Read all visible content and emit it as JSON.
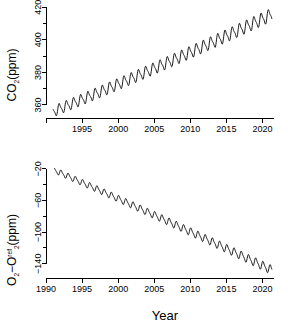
{
  "figure": {
    "width": 288,
    "height": 324,
    "background": "#ffffff",
    "ink": "#000000"
  },
  "chart_data": [
    {
      "id": "co2-panel",
      "type": "line",
      "title": "",
      "xlabel": "",
      "ylabel": "CO2(ppm)",
      "ylabel_parts": {
        "pre": "CO",
        "sub": "2",
        "post": "(ppm)"
      },
      "xlim": [
        1990.0,
        2021.6
      ],
      "ylim": [
        352.0,
        422.0
      ],
      "xticks": [
        1990,
        1995,
        2000,
        2005,
        2010,
        2015,
        2020
      ],
      "xticklabels": [
        "",
        "1995",
        "2000",
        "2005",
        "2010",
        "2015",
        "2020"
      ],
      "yticks": [
        360,
        370,
        380,
        390,
        400,
        410,
        420
      ],
      "yticklabels": [
        "360",
        "",
        "380",
        "",
        "400",
        "",
        "420"
      ],
      "grid": false,
      "legend": "none",
      "series": [
        {
          "name": "CO2 Mauna Loa monthly mean",
          "color": "#000000",
          "trend_start": {
            "x": 1991.0,
            "y": 356.0
          },
          "trend_end": {
            "x": 2021.3,
            "y": 415.5
          },
          "trend_curvature": 4.2,
          "seasonal_amplitude_start": 3.0,
          "seasonal_amplitude_end": 3.6,
          "seasonal_phase": 0.38,
          "samples_per_year": 24
        }
      ]
    },
    {
      "id": "o2-panel",
      "type": "line",
      "title": "",
      "xlabel": "Year",
      "ylabel": "O2-O2ref(ppm)",
      "ylabel_parts": {
        "a": "O",
        "a_sub": "2",
        "dash": "−",
        "b": "O",
        "b_sub": "2",
        "b_sup": "ref",
        "post": "(ppm)"
      },
      "xlim": [
        1990.0,
        2021.6
      ],
      "ylim": [
        -158.0,
        -14.0
      ],
      "xticks": [
        1990,
        1995,
        2000,
        2005,
        2010,
        2015,
        2020
      ],
      "xticklabels": [
        "1990",
        "1995",
        "2000",
        "2005",
        "2010",
        "2015",
        "2020"
      ],
      "yticks": [
        -140,
        -120,
        -100,
        -80,
        -60,
        -40,
        -20
      ],
      "yticklabels": [
        "-140",
        "",
        "-100",
        "",
        "-60",
        "",
        "-20"
      ],
      "grid": false,
      "legend": "none",
      "series": [
        {
          "name": "O2 minus O2 reference, per meg scaled ppm",
          "color": "#000000",
          "trend_start": {
            "x": 1991.2,
            "y": -22.0
          },
          "trend_end": {
            "x": 2021.3,
            "y": -148.0
          },
          "trend_curvature": -5.0,
          "seasonal_amplitude_start": 3.4,
          "seasonal_amplitude_end": 5.2,
          "seasonal_phase": 0.12,
          "samples_per_year": 24
        }
      ]
    }
  ]
}
